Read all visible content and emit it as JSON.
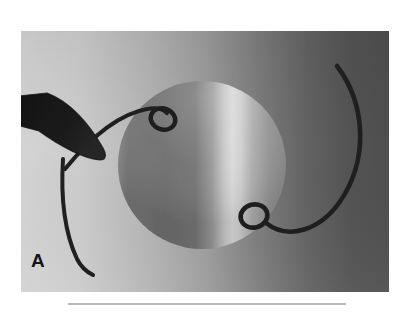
{
  "figure": {
    "panel_label": "A",
    "caption": "",
    "media_type": "grayscale-photograph"
  },
  "plate": {
    "x": 21,
    "y": 31,
    "width": 368,
    "height": 261,
    "background_left_color": "#dcdcdc",
    "background_mid_color": "#9a9a9a",
    "background_right_color": "#4b4b4b"
  },
  "objects": {
    "lens_disc": {
      "name": "lens-disc",
      "center_x": 181,
      "center_y": 134,
      "radius": 84,
      "shade_dark": "#6f6f6f",
      "shade_highlight": "#e2e2e2",
      "shade_right": "#8e8e8e"
    },
    "forceps": {
      "name": "forceps-tip",
      "color": "#101010",
      "tip_x": 79,
      "tip_y": 129
    },
    "upper_loop": {
      "name": "upper-haptic-loop",
      "center_x": 142,
      "center_y": 87,
      "rx": 12,
      "ry": 10,
      "color": "#121212"
    },
    "lower_loop": {
      "name": "lower-haptic-loop",
      "center_x": 234,
      "center_y": 186,
      "rx": 13,
      "ry": 11,
      "color": "#121212"
    },
    "left_haptic_filament": {
      "name": "left-haptic-filament",
      "color": "#141414",
      "stroke_width": 4
    },
    "right_haptic_filament": {
      "name": "right-haptic-filament",
      "color": "#141414",
      "stroke_width": 4.5
    }
  },
  "caption_rule": {
    "x": 68,
    "y": 303,
    "width": 278,
    "color": "#b9b9b9"
  }
}
